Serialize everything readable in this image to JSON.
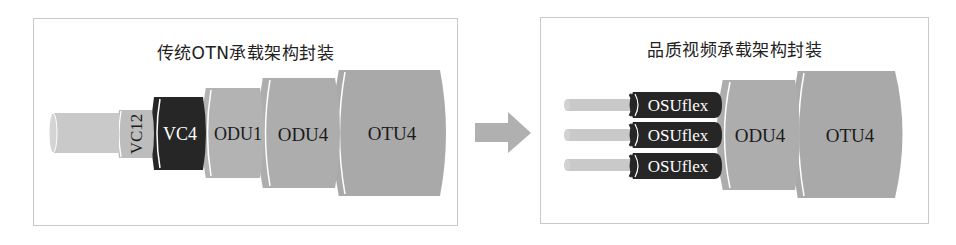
{
  "left_panel": {
    "title": "传统OTN承载架构封装",
    "layers": [
      {
        "id": "core",
        "label": ""
      },
      {
        "id": "vc12",
        "label": "VC12"
      },
      {
        "id": "vc4",
        "label": "VC4"
      },
      {
        "id": "odu1",
        "label": "ODU1"
      },
      {
        "id": "odu4",
        "label": "ODU4"
      },
      {
        "id": "otu4",
        "label": "OTU4"
      }
    ]
  },
  "transition": {
    "icon": "arrow-right-icon"
  },
  "right_panel": {
    "title": "品质视频承载架构封装",
    "channels": [
      {
        "label": "OSUflex"
      },
      {
        "label": "OSUflex"
      },
      {
        "label": "OSUflex"
      }
    ],
    "layers": [
      {
        "id": "odu4",
        "label": "ODU4"
      },
      {
        "id": "otu4",
        "label": "OTU4"
      }
    ]
  },
  "colors": {
    "light_gray": "#c4c4c4",
    "mid_gray": "#a9a9a9",
    "dark": "#262626",
    "border": "#c9c9c9",
    "arrow": "#b0b0b0"
  }
}
